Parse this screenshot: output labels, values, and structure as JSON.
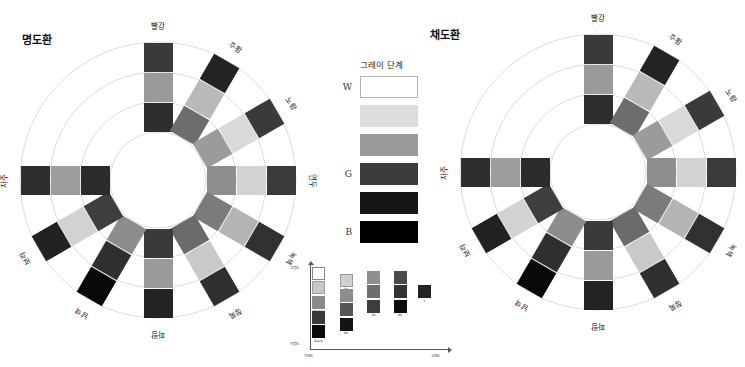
{
  "page": {
    "width": 745,
    "height": 367,
    "background": "#ffffff"
  },
  "wheels": [
    {
      "id": "brightness-wheel",
      "title": "명도환",
      "title_pos": {
        "x": 22,
        "y": 31
      },
      "center": {
        "x": 158,
        "y": 180
      },
      "ring_radii": [
        48,
        78,
        108,
        138
      ],
      "ring_color": "#d9d9d9",
      "swatch_size": 29,
      "swatch_radii": [
        63,
        93,
        123
      ],
      "spoke_label_radius": 155,
      "spokes": [
        {
          "label": "빨강",
          "angle": -90,
          "colors": [
            "#2e2e30",
            "#9a9a9c",
            "#3a3a3c"
          ]
        },
        {
          "label": "주황",
          "angle": -60,
          "colors": [
            "#6d6d6d",
            "#b9b9b9",
            "#232325"
          ]
        },
        {
          "label": "노랑",
          "angle": -30,
          "colors": [
            "#9b9b9b",
            "#d9d9d9",
            "#3a3a3c"
          ]
        },
        {
          "label": "연두",
          "angle": 0,
          "colors": [
            "#8e8e8e",
            "#d3d3d3",
            "#3b3b3d"
          ]
        },
        {
          "label": "녹색",
          "angle": 30,
          "colors": [
            "#7b7b7b",
            "#b4b4b4",
            "#313133"
          ]
        },
        {
          "label": "청록",
          "angle": 60,
          "colors": [
            "#6a6a6a",
            "#c9c9c9",
            "#2f2f31"
          ]
        },
        {
          "label": "파랑",
          "angle": 90,
          "colors": [
            "#3a3a3c",
            "#9a9a9c",
            "#232325"
          ]
        },
        {
          "label": "남색",
          "angle": 120,
          "colors": [
            "#8c8c8c",
            "#2f2f31",
            "#09090a"
          ]
        },
        {
          "label": "보라",
          "angle": 150,
          "colors": [
            "#3e3e40",
            "#d2d2d2",
            "#222224"
          ]
        },
        {
          "label": "자주",
          "angle": 180,
          "colors": [
            "#2b2b2d",
            "#9d9d9d",
            "#2e2e30"
          ]
        }
      ]
    },
    {
      "id": "saturation-wheel",
      "title": "채도환",
      "title_pos": {
        "x": 430,
        "y": 26
      },
      "center": {
        "x": 598,
        "y": 172
      },
      "ring_radii": [
        48,
        78,
        108,
        138
      ],
      "ring_color": "#d9d9d9",
      "swatch_size": 29,
      "swatch_radii": [
        63,
        93,
        123
      ],
      "spoke_label_radius": 155,
      "spokes": [
        {
          "label": "빨강",
          "angle": -90,
          "colors": [
            "#2e2e30",
            "#9a9a9c",
            "#3a3a3c"
          ]
        },
        {
          "label": "주황",
          "angle": -60,
          "colors": [
            "#6d6d6d",
            "#b9b9b9",
            "#232325"
          ]
        },
        {
          "label": "노랑",
          "angle": -30,
          "colors": [
            "#9b9b9b",
            "#d9d9d9",
            "#3a3a3c"
          ]
        },
        {
          "label": "연두",
          "angle": 0,
          "colors": [
            "#8e8e8e",
            "#d3d3d3",
            "#3b3b3d"
          ]
        },
        {
          "label": "녹색",
          "angle": 30,
          "colors": [
            "#7b7b7b",
            "#b4b4b4",
            "#313133"
          ]
        },
        {
          "label": "청록",
          "angle": 60,
          "colors": [
            "#6a6a6a",
            "#c9c9c9",
            "#2f2f31"
          ]
        },
        {
          "label": "파랑",
          "angle": 90,
          "colors": [
            "#3a3a3c",
            "#9a9a9c",
            "#232325"
          ]
        },
        {
          "label": "남색",
          "angle": 120,
          "colors": [
            "#8c8c8c",
            "#2f2f31",
            "#09090a"
          ]
        },
        {
          "label": "보라",
          "angle": 150,
          "colors": [
            "#3e3e40",
            "#d2d2d2",
            "#222224"
          ]
        },
        {
          "label": "자주",
          "angle": 180,
          "colors": [
            "#2b2b2d",
            "#9d9d9d",
            "#2e2e30"
          ]
        }
      ]
    }
  ],
  "gray_legend": {
    "title": "그레이 단계",
    "end_labels": {
      "white": "W",
      "mid": "G",
      "black": "B"
    },
    "steps": [
      {
        "name": "white",
        "color": "#ffffff",
        "border": "#b5b5b5",
        "end_label": "W"
      },
      {
        "name": "light-gray",
        "color": "#dcdcdc",
        "border": "",
        "end_label": ""
      },
      {
        "name": "mid-gray",
        "color": "#9a9a9a",
        "border": "",
        "end_label": ""
      },
      {
        "name": "dark-gray",
        "color": "#3c3c3e",
        "border": "",
        "end_label": "G"
      },
      {
        "name": "near-black",
        "color": "#161618",
        "border": "",
        "end_label": ""
      },
      {
        "name": "black",
        "color": "#000000",
        "border": "",
        "end_label": "B"
      }
    ]
  },
  "chart_data": {
    "type": "scatter",
    "title": "",
    "xlabel": "저채도  →  고채도",
    "ylabel": "저명도  →  고명도",
    "x_axis_labels": {
      "left": "저채도",
      "right": "고채도"
    },
    "y_axis_labels": {
      "bottom": "저명도",
      "top": "고명도"
    },
    "grid": false,
    "legend": "none",
    "xlim": [
      0,
      6
    ],
    "ylim": [
      0,
      6
    ],
    "points": [
      {
        "label": "White",
        "x": 0.3,
        "y": 5.55,
        "color": "#ffffff",
        "border": "#888888"
      },
      {
        "label": "L.gray",
        "x": 0.3,
        "y": 4.45,
        "color": "#c6c6c6",
        "border": "#9a9a9a"
      },
      {
        "label": "M.gray",
        "x": 0.3,
        "y": 3.35,
        "color": "#8a8a8a",
        "border": ""
      },
      {
        "label": "D.gray",
        "x": 0.3,
        "y": 2.25,
        "color": "#3a3a3c",
        "border": ""
      },
      {
        "label": "Black",
        "x": 0.3,
        "y": 1.15,
        "color": "#0a0a0a",
        "border": ""
      },
      {
        "label": "5p",
        "x": 1.55,
        "y": 5.0,
        "color": "#cfcfcf",
        "border": "#9a9a9a"
      },
      {
        "label": "Light",
        "x": 1.55,
        "y": 3.9,
        "color": "#8d8d8d",
        "border": ""
      },
      {
        "label": "4b",
        "x": 1.55,
        "y": 2.8,
        "color": "#555557",
        "border": ""
      },
      {
        "label": "8b",
        "x": 1.55,
        "y": 1.7,
        "color": "#141416",
        "border": ""
      },
      {
        "label": "4",
        "x": 2.8,
        "y": 5.25,
        "color": "#8f8f8f",
        "border": ""
      },
      {
        "label": "3",
        "x": 2.8,
        "y": 4.15,
        "color": "#6e6e70",
        "border": ""
      },
      {
        "label": "2b",
        "x": 2.8,
        "y": 3.05,
        "color": "#3d3d3f",
        "border": ""
      },
      {
        "label": "6",
        "x": 4.0,
        "y": 5.25,
        "color": "#4a4a4c",
        "border": ""
      },
      {
        "label": "2",
        "x": 4.0,
        "y": 4.15,
        "color": "#333335",
        "border": ""
      },
      {
        "label": "9b",
        "x": 4.0,
        "y": 3.05,
        "color": "#0e0e10",
        "border": ""
      },
      {
        "label": "1",
        "x": 5.1,
        "y": 4.15,
        "color": "#242426",
        "border": ""
      }
    ]
  }
}
